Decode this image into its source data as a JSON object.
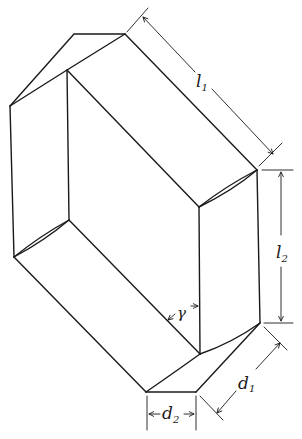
{
  "figure": {
    "stroke_color": "#1a1a1a",
    "background": "#ffffff"
  },
  "labels": {
    "l1": {
      "base": "l",
      "sub": "1"
    },
    "l2": {
      "base": "l",
      "sub": "2"
    },
    "d1": {
      "base": "d",
      "sub": "1"
    },
    "d2": {
      "base": "d",
      "sub": "2"
    },
    "gamma": {
      "base": "γ"
    }
  }
}
